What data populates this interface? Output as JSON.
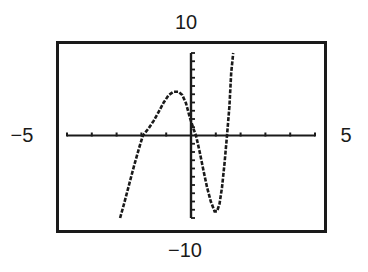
{
  "window": {
    "xmin_label": "−5",
    "xmax_label": "5",
    "ymin_label": "−10",
    "ymax_label": "10"
  },
  "colors": {
    "frame": "#1a1a1a",
    "axes": "#1a1a1a",
    "curve": "#1a1a1a",
    "background": "#ffffff"
  },
  "chart_data": {
    "type": "line",
    "title": "",
    "xlabel": "",
    "ylabel": "",
    "xlim": [
      -5,
      5
    ],
    "ylim": [
      -10,
      10
    ],
    "xscale": 1,
    "yscale": 1,
    "grid": false,
    "legend": null,
    "annotations": [
      "-5",
      "5",
      "-10",
      "10"
    ],
    "series": [
      {
        "name": "y",
        "x": [
          -2.86,
          -2.7,
          -2.5,
          -2.3,
          -2.1,
          -1.94,
          -1.7,
          -1.5,
          -1.3,
          -1.1,
          -0.9,
          -0.7,
          -0.5,
          -0.35,
          -0.2,
          -0.05,
          0.1,
          0.2,
          0.35,
          0.5,
          0.65,
          0.8,
          0.95,
          1.05,
          1.15,
          1.25,
          1.35,
          1.45,
          1.55,
          1.62,
          1.7
        ],
        "y": [
          -10.0,
          -8.3,
          -6.0,
          -3.7,
          -1.6,
          0.0,
          0.9,
          1.8,
          2.9,
          4.0,
          4.9,
          5.3,
          5.3,
          4.9,
          3.9,
          2.2,
          0.8,
          0.0,
          -2.0,
          -4.2,
          -6.3,
          -8.0,
          -9.2,
          -9.2,
          -8.3,
          -6.3,
          -3.4,
          0.0,
          3.5,
          7.6,
          10.0
        ]
      }
    ]
  }
}
